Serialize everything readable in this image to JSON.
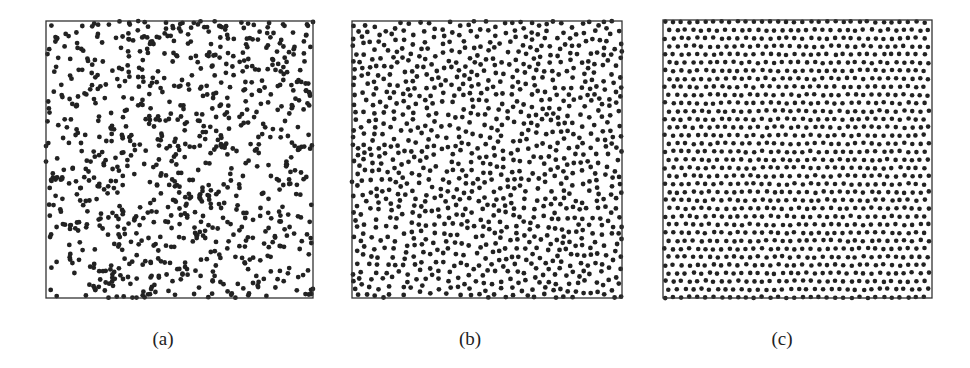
{
  "figure": {
    "background": "#ffffff",
    "dot_color": "#222222",
    "frame_color": "#333333"
  },
  "chart_data": [
    {
      "type": "scatter",
      "title": "",
      "caption": "(a)",
      "description": "Uniform random (Poisson) point distribution in unit square; clustered with gaps",
      "pattern": "random",
      "approx_points": 900,
      "xlim": [
        0,
        1
      ],
      "ylim": [
        0,
        1
      ],
      "grid": false,
      "legend": null
    },
    {
      "type": "scatter",
      "title": "",
      "caption": "(b)",
      "description": "Partially ordered / hard-core (blue-noise) distribution; short diagonal chains",
      "pattern": "blue-noise",
      "approx_points": 1000,
      "xlim": [
        0,
        1
      ],
      "ylim": [
        0,
        1
      ],
      "grid": false,
      "legend": null
    },
    {
      "type": "scatter",
      "title": "",
      "caption": "(c)",
      "description": "Highly ordered, near-lattice (low-discrepancy) distribution with diagonal pairs",
      "pattern": "lattice",
      "approx_points": 1100,
      "xlim": [
        0,
        1
      ],
      "ylim": [
        0,
        1
      ],
      "grid": false,
      "legend": null
    }
  ],
  "panels": [
    {
      "id": "a",
      "left": 46,
      "top": 21,
      "width": 267,
      "height": 277,
      "caption_left": 148
    },
    {
      "id": "b",
      "left": 352,
      "top": 21,
      "width": 270,
      "height": 277,
      "caption_left": 455
    },
    {
      "id": "c",
      "left": 663,
      "top": 20,
      "width": 269,
      "height": 278,
      "caption_left": 767
    }
  ]
}
